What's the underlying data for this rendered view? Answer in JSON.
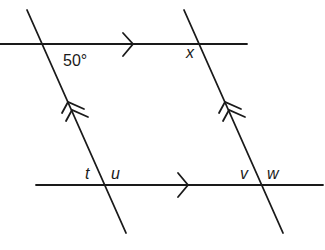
{
  "diagram": {
    "type": "parallel-lines-angles",
    "stroke_color": "#1a1a1a",
    "lines": [
      {
        "id": "top-horizontal",
        "x1": 0,
        "y1": 44,
        "x2": 247,
        "y2": 44,
        "marker": "single-arrow"
      },
      {
        "id": "bottom-horizontal",
        "x1": 36,
        "y1": 185,
        "x2": 323,
        "y2": 185,
        "marker": "single-arrow"
      },
      {
        "id": "left-transversal",
        "x1": 27,
        "y1": 10,
        "x2": 126,
        "y2": 233,
        "marker": "double-arrow"
      },
      {
        "id": "right-transversal",
        "x1": 184,
        "y1": 10,
        "x2": 283,
        "y2": 233,
        "marker": "double-arrow"
      }
    ],
    "labels": {
      "angle_given": "50°",
      "x": "x",
      "t": "t",
      "u": "u",
      "v": "v",
      "w": "w"
    }
  }
}
